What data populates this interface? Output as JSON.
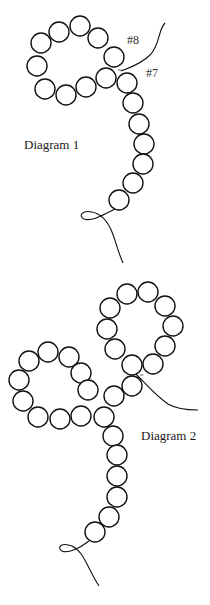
{
  "diagram1": {
    "title": "Diagram 1",
    "label_8": "#8",
    "label_7": "#7",
    "beads": [
      [
        41,
        43
      ],
      [
        59,
        32
      ],
      [
        80,
        26
      ],
      [
        98,
        38
      ],
      [
        114,
        57
      ],
      [
        106,
        78
      ],
      [
        86,
        87
      ],
      [
        66,
        95
      ],
      [
        45,
        89
      ],
      [
        37,
        66
      ],
      [
        127,
        83
      ],
      [
        133,
        103
      ],
      [
        139,
        124
      ],
      [
        144,
        144
      ],
      [
        143,
        164
      ],
      [
        133,
        183
      ],
      [
        119,
        200
      ]
    ]
  },
  "diagram2": {
    "title": "Diagram 2",
    "beads": [
      [
        127,
        294
      ],
      [
        148,
        292
      ],
      [
        165,
        306
      ],
      [
        173,
        326
      ],
      [
        165,
        346
      ],
      [
        153,
        364
      ],
      [
        132,
        365
      ],
      [
        115,
        349
      ],
      [
        107,
        329
      ],
      [
        110,
        308
      ],
      [
        29,
        361
      ],
      [
        48,
        352
      ],
      [
        69,
        357
      ],
      [
        81,
        373
      ],
      [
        88,
        390
      ],
      [
        81,
        416
      ],
      [
        60,
        419
      ],
      [
        38,
        417
      ],
      [
        23,
        401
      ],
      [
        19,
        380
      ],
      [
        132,
        386
      ],
      [
        114,
        396
      ],
      [
        104,
        417
      ],
      [
        113,
        436
      ],
      [
        117,
        455
      ],
      [
        117,
        476
      ],
      [
        117,
        497
      ],
      [
        109,
        517
      ],
      [
        95,
        532
      ]
    ]
  },
  "style": {
    "stroke": "#111111",
    "bead_radius": 10
  }
}
